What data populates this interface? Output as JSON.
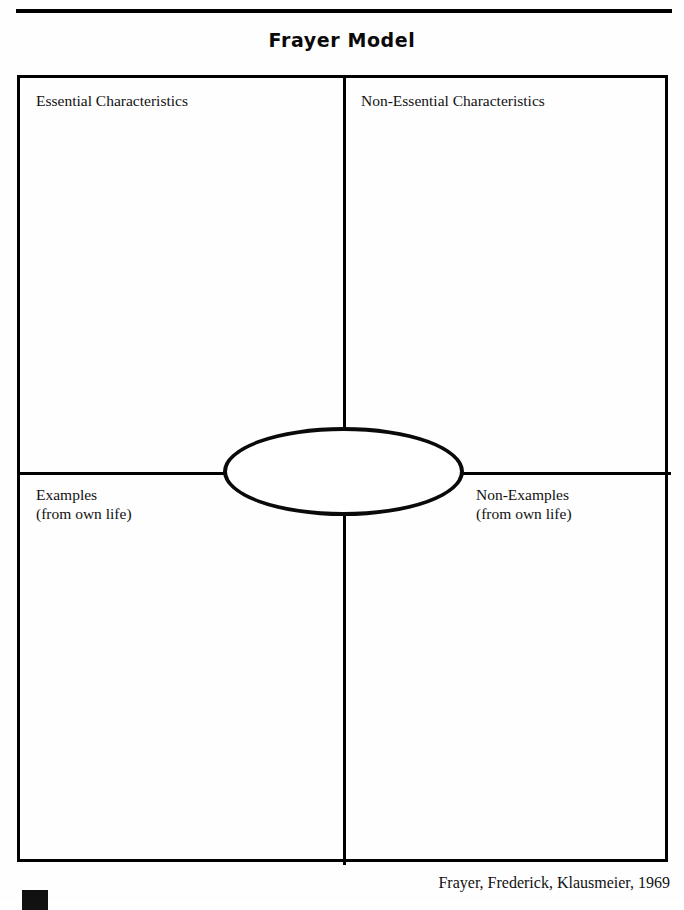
{
  "document": {
    "title": "Frayer Model",
    "attribution": "Frayer, Frederick, Klausmeier, 1969"
  },
  "quadrants": {
    "top_left": {
      "label": "Essential Characteristics",
      "content": ""
    },
    "top_right": {
      "label": "Non-Essential Characteristics",
      "content": ""
    },
    "bottom_left": {
      "label": "Examples\n(from own life)",
      "content": ""
    },
    "bottom_right": {
      "label": "Non-Examples\n(from own life)",
      "content": ""
    }
  },
  "center": {
    "label": "",
    "shape": "ellipse"
  },
  "colors": {
    "ink": "#000000",
    "page": "#ffffff"
  },
  "icons": {
    "corner_mark": "black-square-mark"
  }
}
